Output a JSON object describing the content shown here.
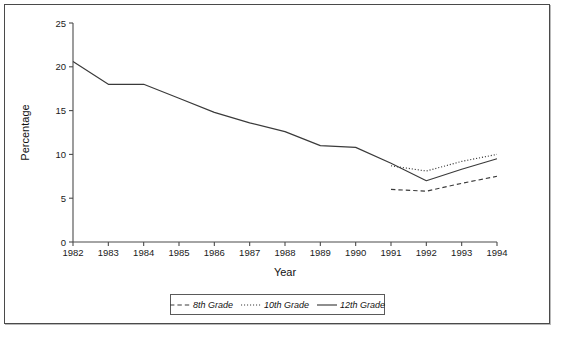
{
  "chart_data": {
    "type": "line",
    "title": "",
    "xlabel": "Year",
    "ylabel": "Percentage",
    "x": [
      1982,
      1983,
      1984,
      1985,
      1986,
      1987,
      1988,
      1989,
      1990,
      1991,
      1992,
      1993,
      1994
    ],
    "xticklabels": [
      "1982",
      "1983",
      "1984",
      "1985",
      "1986",
      "1987",
      "1988",
      "1989",
      "1990",
      "1991",
      "1992",
      "1993",
      "1994"
    ],
    "yticklabels": [
      "0",
      "5",
      "10",
      "15",
      "20",
      "25"
    ],
    "ytickvalues": [
      0,
      5,
      10,
      15,
      20,
      25
    ],
    "xlim": [
      1982,
      1994
    ],
    "ylim": [
      0,
      25
    ],
    "grid": false,
    "legend_position": "below-axes",
    "series": [
      {
        "name": "8th Grade",
        "style": "dashed",
        "x": [
          1991,
          1992,
          1993,
          1994
        ],
        "values": [
          6.0,
          5.8,
          6.7,
          7.5
        ]
      },
      {
        "name": "10th Grade",
        "style": "dotted",
        "x": [
          1991,
          1992,
          1993,
          1994
        ],
        "values": [
          8.7,
          8.1,
          9.2,
          10.0
        ]
      },
      {
        "name": "12th Grade",
        "style": "solid",
        "x": [
          1982,
          1983,
          1984,
          1985,
          1986,
          1987,
          1988,
          1989,
          1990,
          1991,
          1992,
          1993,
          1994
        ],
        "values": [
          20.6,
          18.0,
          18.0,
          16.4,
          14.8,
          13.6,
          12.6,
          11.0,
          10.8,
          9.0,
          7.0,
          8.3,
          9.5
        ]
      }
    ]
  },
  "axes": {
    "ylabel": "Percentage",
    "xlabel": "Year"
  },
  "legend": {
    "entries": [
      {
        "label": "8th Grade",
        "style": "dashed"
      },
      {
        "label": "10th Grade",
        "style": "dotted"
      },
      {
        "label": "12th Grade",
        "style": "solid"
      }
    ]
  },
  "footnote": {
    "text": ""
  }
}
